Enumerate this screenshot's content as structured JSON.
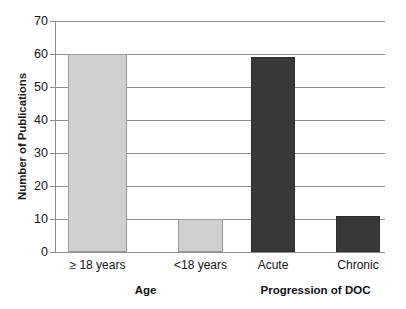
{
  "chart_data": {
    "type": "bar",
    "title": "",
    "subtitle": "",
    "xlabel": "",
    "ylabel": "Number of Publications",
    "categories": [
      "≥ 18 years",
      "<18 years",
      "Acute",
      "Chronic"
    ],
    "values": [
      60,
      10,
      59,
      11
    ],
    "series": [
      {
        "name": "Number of Publications",
        "values": [
          60,
          10,
          59,
          11
        ]
      }
    ],
    "groups": [
      {
        "label": "Age",
        "categories": [
          "≥ 18 years",
          "<18 years"
        ],
        "color": "#d0d0d0"
      },
      {
        "label": "Progression of DOC",
        "categories": [
          "Acute",
          "Chronic"
        ],
        "color": "#383838"
      }
    ],
    "bars": [
      {
        "category": "≥ 18 years",
        "value": 60,
        "group": "Age",
        "color": "#d0d0d0"
      },
      {
        "category": "<18 years",
        "value": 10,
        "group": "Age",
        "color": "#d0d0d0"
      },
      {
        "category": "Acute",
        "value": 59,
        "group": "Progression of DOC",
        "color": "#383838"
      },
      {
        "category": "Chronic",
        "value": 11,
        "group": "Progression of DOC",
        "color": "#383838"
      }
    ],
    "ylim": [
      0,
      70
    ],
    "ytick_values": [
      0,
      10,
      20,
      30,
      40,
      50,
      60,
      70
    ],
    "ytick_labels": [
      "0",
      "10",
      "20",
      "30",
      "40",
      "50",
      "60",
      "70"
    ],
    "grid": true,
    "grid_axis": "y",
    "legend": false,
    "legend_position": "none",
    "annotations": [],
    "colors": {
      "light_bar": "#d0d0d0",
      "dark_bar": "#383838",
      "gridline": "#8d8d8d",
      "axis": "#8d8d8d",
      "text": "#111111",
      "background": "#ffffff"
    }
  }
}
